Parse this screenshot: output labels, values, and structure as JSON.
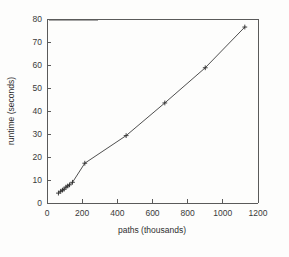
{
  "figure": {
    "width": 289,
    "height": 257,
    "background_color": "#fdfdfc",
    "axis_color": "#5a5a5a",
    "line_color": "#3b3b3b",
    "marker_color": "#2e2e2e",
    "legend_key_color": "#8f8f8f"
  },
  "chart_data": {
    "type": "line",
    "title": "",
    "subtitle": "",
    "xlabel": "paths (thousands)",
    "ylabel": "runtime (seconds)",
    "xlim": [
      0,
      1200
    ],
    "ylim": [
      0,
      80
    ],
    "xticks": [
      0,
      200,
      400,
      600,
      800,
      1000,
      1200
    ],
    "yticks": [
      0,
      10,
      20,
      30,
      40,
      50,
      60,
      70,
      80
    ],
    "xticklabels": [
      "0",
      "200",
      "400",
      "600",
      "800",
      "1000",
      "1200"
    ],
    "yticklabels": [
      "0",
      "10",
      "20",
      "30",
      "40",
      "50",
      "60",
      "70",
      "80"
    ],
    "grid": false,
    "legend": {
      "visible": true,
      "position": "top-left-inside",
      "entries": [
        {
          "label": "",
          "marker": "plus",
          "linestyle": "solid"
        }
      ]
    },
    "marker": "plus",
    "series": [
      {
        "name": "runtime",
        "x": [
          65,
          78,
          88,
          97,
          108,
          118,
          128,
          145,
          215,
          450,
          670,
          900,
          1125
        ],
        "y": [
          4.3,
          5.1,
          5.6,
          6.0,
          6.9,
          7.4,
          7.9,
          9.0,
          17.3,
          29.3,
          43.5,
          58.8,
          76.5
        ]
      }
    ],
    "annotations": []
  }
}
